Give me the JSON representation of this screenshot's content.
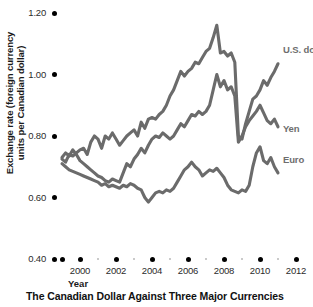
{
  "chart_data": {
    "type": "line",
    "title": "The Canadian Dollar Against Three Major Currencies",
    "xlabel": "Year",
    "ylabel": "Exchange rate (foreign currency\nunits per Canadian dollar)",
    "xlim": [
      1999,
      2012
    ],
    "ylim": [
      0.4,
      1.2
    ],
    "grid": false,
    "legend_position": "inline-right-end-of-line",
    "yticks": [
      1.2,
      1.0,
      0.8,
      0.6,
      0.4
    ],
    "ytick_labels": [
      "1.20",
      "1.00",
      "0.80",
      "0.60",
      "0.40"
    ],
    "xticks": [
      2000,
      2002,
      2004,
      2006,
      2008,
      2010,
      2012
    ],
    "xtick_labels": [
      "2000",
      "2002",
      "2004",
      "2006",
      "2008",
      "2010",
      "2012"
    ],
    "xticks_minor": [
      1999,
      2001,
      2003,
      2005,
      2007,
      2009,
      2011
    ],
    "line_color": "#6b6b6b",
    "axis_text_color": "#2b2b2b",
    "series": [
      {
        "name": "U.S. dollar",
        "label": "U.S. dollar",
        "x": [
          1999.0,
          1999.2,
          1999.4,
          1999.6,
          1999.8,
          2000.0,
          2000.2,
          2000.4,
          2000.6,
          2000.8,
          2001.0,
          2001.2,
          2001.4,
          2001.6,
          2001.8,
          2002.0,
          2002.2,
          2002.4,
          2002.6,
          2002.8,
          2003.0,
          2003.2,
          2003.4,
          2003.6,
          2003.8,
          2004.0,
          2004.2,
          2004.4,
          2004.6,
          2004.8,
          2005.0,
          2005.2,
          2005.4,
          2005.6,
          2005.8,
          2006.0,
          2006.2,
          2006.4,
          2006.6,
          2006.8,
          2007.0,
          2007.2,
          2007.4,
          2007.6,
          2007.8,
          2008.0,
          2008.2,
          2008.4,
          2008.6,
          2008.8,
          2009.0,
          2009.2,
          2009.4,
          2009.6,
          2009.8,
          2010.0,
          2010.2,
          2010.4,
          2010.6,
          2010.8,
          2011.0
        ],
        "y": [
          0.725,
          0.715,
          0.74,
          0.735,
          0.745,
          0.755,
          0.76,
          0.74,
          0.78,
          0.8,
          0.79,
          0.76,
          0.8,
          0.79,
          0.81,
          0.79,
          0.77,
          0.785,
          0.8,
          0.81,
          0.82,
          0.8,
          0.845,
          0.825,
          0.855,
          0.86,
          0.855,
          0.87,
          0.88,
          0.9,
          0.93,
          0.95,
          0.98,
          1.01,
          0.995,
          1.01,
          1.02,
          1.04,
          1.035,
          1.055,
          1.075,
          1.085,
          1.12,
          1.16,
          1.07,
          1.075,
          1.06,
          1.07,
          1.04,
          0.8,
          0.79,
          0.84,
          0.88,
          0.92,
          0.93,
          0.95,
          0.98,
          0.965,
          0.99,
          1.01,
          1.035
        ],
        "end_label_xy": [
          2011.05,
          1.035
        ]
      },
      {
        "name": "Yen",
        "label": "Yen",
        "x": [
          1999.0,
          1999.2,
          1999.4,
          1999.6,
          1999.8,
          2000.0,
          2000.2,
          2000.4,
          2000.6,
          2000.8,
          2001.0,
          2001.2,
          2001.4,
          2001.6,
          2001.8,
          2002.0,
          2002.2,
          2002.4,
          2002.6,
          2002.8,
          2003.0,
          2003.2,
          2003.4,
          2003.6,
          2003.8,
          2004.0,
          2004.2,
          2004.4,
          2004.6,
          2004.8,
          2005.0,
          2005.2,
          2005.4,
          2005.6,
          2005.8,
          2006.0,
          2006.2,
          2006.4,
          2006.6,
          2006.8,
          2007.0,
          2007.2,
          2007.4,
          2007.6,
          2007.8,
          2008.0,
          2008.2,
          2008.4,
          2008.6,
          2008.8,
          2009.0,
          2009.2,
          2009.4,
          2009.6,
          2009.8,
          2010.0,
          2010.2,
          2010.4,
          2010.6,
          2010.8,
          2011.0
        ],
        "y": [
          0.73,
          0.745,
          0.735,
          0.755,
          0.74,
          0.72,
          0.71,
          0.7,
          0.69,
          0.68,
          0.67,
          0.665,
          0.655,
          0.65,
          0.66,
          0.655,
          0.65,
          0.68,
          0.71,
          0.7,
          0.725,
          0.74,
          0.76,
          0.745,
          0.77,
          0.79,
          0.8,
          0.795,
          0.81,
          0.8,
          0.79,
          0.8,
          0.82,
          0.84,
          0.83,
          0.85,
          0.87,
          0.865,
          0.88,
          0.87,
          0.88,
          0.9,
          0.95,
          1.0,
          0.96,
          0.98,
          0.95,
          0.96,
          0.93,
          0.78,
          0.8,
          0.83,
          0.85,
          0.865,
          0.88,
          0.9,
          0.875,
          0.85,
          0.84,
          0.855,
          0.83
        ],
        "end_label_xy": [
          2011.05,
          0.855
        ]
      },
      {
        "name": "Euro",
        "label": "Euro",
        "x": [
          1999.0,
          1999.2,
          1999.4,
          1999.6,
          1999.8,
          2000.0,
          2000.2,
          2000.4,
          2000.6,
          2000.8,
          2001.0,
          2001.2,
          2001.4,
          2001.6,
          2001.8,
          2002.0,
          2002.2,
          2002.4,
          2002.6,
          2002.8,
          2003.0,
          2003.2,
          2003.4,
          2003.6,
          2003.8,
          2004.0,
          2004.2,
          2004.4,
          2004.6,
          2004.8,
          2005.0,
          2005.2,
          2005.4,
          2005.6,
          2005.8,
          2006.0,
          2006.2,
          2006.4,
          2006.6,
          2006.8,
          2007.0,
          2007.2,
          2007.4,
          2007.6,
          2007.8,
          2008.0,
          2008.2,
          2008.4,
          2008.6,
          2008.8,
          2009.0,
          2009.2,
          2009.4,
          2009.6,
          2009.8,
          2010.0,
          2010.2,
          2010.4,
          2010.6,
          2010.8,
          2011.0
        ],
        "y": [
          0.71,
          0.7,
          0.69,
          0.685,
          0.68,
          0.675,
          0.67,
          0.665,
          0.66,
          0.655,
          0.65,
          0.64,
          0.645,
          0.635,
          0.64,
          0.635,
          0.63,
          0.64,
          0.635,
          0.645,
          0.64,
          0.63,
          0.625,
          0.6,
          0.585,
          0.6,
          0.615,
          0.62,
          0.615,
          0.625,
          0.62,
          0.63,
          0.65,
          0.67,
          0.69,
          0.7,
          0.715,
          0.7,
          0.69,
          0.67,
          0.68,
          0.69,
          0.685,
          0.695,
          0.68,
          0.665,
          0.64,
          0.625,
          0.62,
          0.615,
          0.625,
          0.62,
          0.64,
          0.7,
          0.745,
          0.765,
          0.72,
          0.71,
          0.73,
          0.7,
          0.68
        ],
        "end_label_xy": [
          2011.05,
          0.69
        ]
      }
    ]
  }
}
